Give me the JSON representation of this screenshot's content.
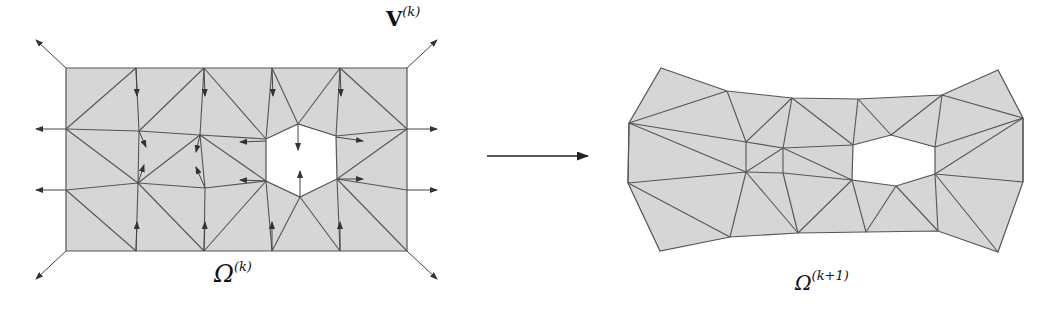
{
  "figure": {
    "left_mesh": {
      "label_symbol": "Ω",
      "label_superscript": "(k)",
      "vector_label": "V",
      "vector_superscript": "(k)",
      "fill_color": "#d6d6d6",
      "stroke_color": "#555555"
    },
    "transition_arrow": {
      "direction": "right"
    },
    "right_mesh": {
      "label_symbol": "Ω",
      "label_superscript": "(k+1)",
      "fill_color": "#d6d6d6",
      "stroke_color": "#555555"
    }
  }
}
